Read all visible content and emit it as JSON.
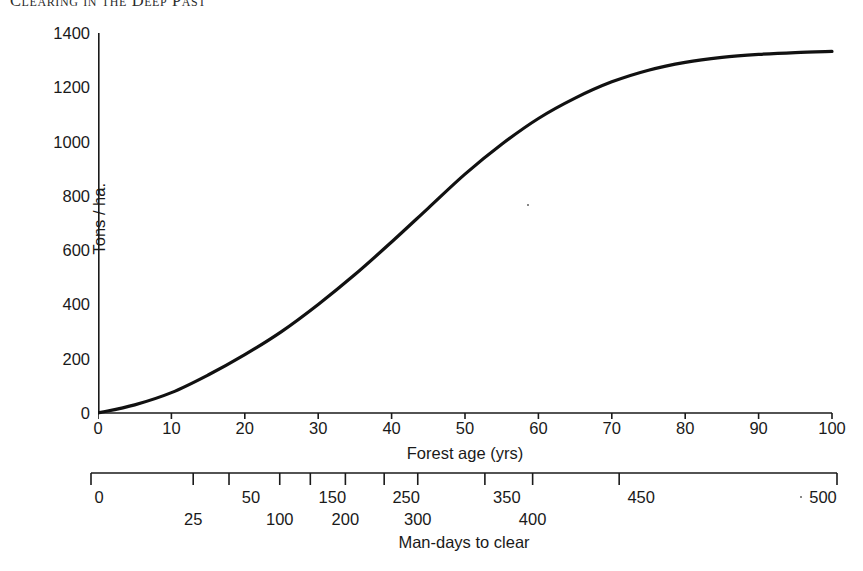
{
  "page": {
    "running_header": "Clearing in the Deep Past",
    "background_color": "#ffffff",
    "ink_color": "#1a1a1a"
  },
  "chart_data": {
    "type": "line",
    "title": "",
    "xlabel": "Forest age (yrs)",
    "ylabel": "Tons / ha.",
    "xlim": [
      0,
      100
    ],
    "ylim": [
      0,
      1400
    ],
    "grid": false,
    "legend": null,
    "line_color": "#111111",
    "line_width": 3,
    "x_ticks": [
      0,
      10,
      20,
      30,
      40,
      50,
      60,
      70,
      80,
      90,
      100
    ],
    "x_tick_labels": [
      "0",
      "10",
      "20",
      "30",
      "40",
      "50",
      "60",
      "70",
      "80",
      "90",
      "100"
    ],
    "y_ticks": [
      0,
      200,
      400,
      600,
      800,
      1000,
      1200,
      1400
    ],
    "y_tick_labels": [
      "0",
      "200",
      "400",
      "600",
      "800",
      "1000",
      "1200",
      "1400"
    ],
    "series": [
      {
        "name": "Above-ground biomass accumulation",
        "x": [
          0,
          5,
          10,
          15,
          20,
          25,
          30,
          35,
          40,
          45,
          50,
          55,
          60,
          65,
          70,
          75,
          80,
          85,
          90,
          95,
          100
        ],
        "values": [
          0,
          30,
          75,
          140,
          215,
          300,
          400,
          510,
          630,
          755,
          880,
          990,
          1085,
          1160,
          1220,
          1263,
          1292,
          1310,
          1321,
          1328,
          1332
        ]
      }
    ],
    "secondary_axis": {
      "label": "Man-days to clear",
      "range": [
        0,
        500
      ],
      "note": "tick marks are non-linearly spaced against forest age; labels alternate between two rows",
      "ticks": [
        {
          "value": 0,
          "label": "0",
          "forest_age": 0,
          "row": "upper"
        },
        {
          "value": 25,
          "label": "25",
          "forest_age": 13.7,
          "row": "lower"
        },
        {
          "value": 50,
          "label": "50",
          "forest_age": 18.5,
          "row": "upper"
        },
        {
          "value": 100,
          "label": "100",
          "forest_age": 25.3,
          "row": "lower"
        },
        {
          "value": 150,
          "label": "150",
          "forest_age": 29.4,
          "row": "upper"
        },
        {
          "value": 200,
          "label": "200",
          "forest_age": 34.1,
          "row": "lower"
        },
        {
          "value": 250,
          "label": "250",
          "forest_age": 39.3,
          "row": "upper"
        },
        {
          "value": 300,
          "label": "300",
          "forest_age": 43.8,
          "row": "lower"
        },
        {
          "value": 350,
          "label": "350",
          "forest_age": 52.8,
          "row": "upper"
        },
        {
          "value": 400,
          "label": "400",
          "forest_age": 59.2,
          "row": "lower"
        },
        {
          "value": 450,
          "label": "450",
          "forest_age": 70.8,
          "row": "upper"
        },
        {
          "value": 500,
          "label": "500",
          "forest_age": 100,
          "row": "upper"
        }
      ]
    }
  }
}
